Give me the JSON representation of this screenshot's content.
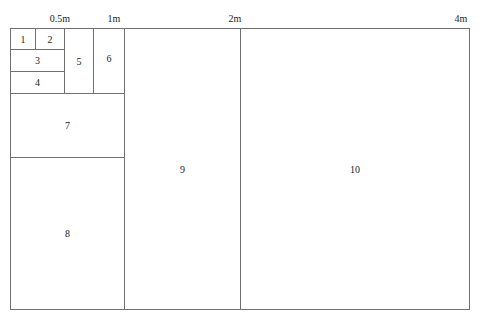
{
  "scale_labels": [
    {
      "label": "0.5m",
      "x": 60
    },
    {
      "label": "1m",
      "x": 114
    },
    {
      "label": "2m",
      "x": 235
    },
    {
      "label": "4m",
      "x": 461
    }
  ],
  "cells": [
    {
      "label": "1",
      "x": 10,
      "y": 28,
      "w": 26,
      "h": 22
    },
    {
      "label": "2",
      "x": 35,
      "y": 28,
      "w": 30,
      "h": 22
    },
    {
      "label": "3",
      "x": 10,
      "y": 49,
      "w": 55,
      "h": 23
    },
    {
      "label": "4",
      "x": 10,
      "y": 71,
      "w": 55,
      "h": 23
    },
    {
      "label": "5",
      "x": 64,
      "y": 28,
      "w": 30,
      "h": 66
    },
    {
      "label": "6",
      "x": 93,
      "y": 28,
      "w": 32,
      "h": 66
    },
    {
      "label": "7",
      "x": 10,
      "y": 93,
      "w": 115,
      "h": 65
    },
    {
      "label": "8",
      "x": 10,
      "y": 157,
      "w": 115,
      "h": 153
    },
    {
      "label": "9",
      "x": 124,
      "y": 28,
      "w": 117,
      "h": 282
    },
    {
      "label": "10",
      "x": 240,
      "y": 28,
      "w": 230,
      "h": 282
    }
  ]
}
